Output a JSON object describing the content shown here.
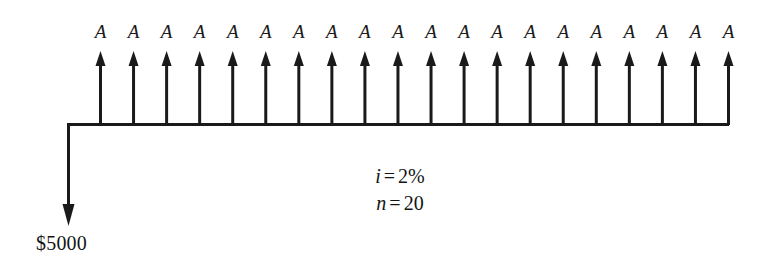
{
  "diagram": {
    "type": "cash-flow-diagram",
    "title": "",
    "background_color": "#ffffff",
    "line_color": "#1a1a1a",
    "principal": {
      "label": "$5000",
      "direction": "down",
      "period": 0
    },
    "annuity": {
      "label": "A",
      "direction": "up",
      "count": 20,
      "labels": [
        "A",
        "A",
        "A",
        "A",
        "A",
        "A",
        "A",
        "A",
        "A",
        "A",
        "A",
        "A",
        "A",
        "A",
        "A",
        "A",
        "A",
        "A",
        "A",
        "A"
      ]
    },
    "parameters": [
      {
        "symbol": "i",
        "equals": "=",
        "value": "2%"
      },
      {
        "symbol": "n",
        "equals": "=",
        "value": "20"
      }
    ]
  },
  "chart_data": {
    "type": "bar",
    "title": "",
    "xlabel": "",
    "ylabel": "",
    "categories": [
      "0",
      "1",
      "2",
      "3",
      "4",
      "5",
      "6",
      "7",
      "8",
      "9",
      "10",
      "11",
      "12",
      "13",
      "14",
      "15",
      "16",
      "17",
      "18",
      "19",
      "20"
    ],
    "values": [
      -5000,
      1,
      1,
      1,
      1,
      1,
      1,
      1,
      1,
      1,
      1,
      1,
      1,
      1,
      1,
      1,
      1,
      1,
      1,
      1,
      1
    ],
    "annotations": [
      "i = 2%",
      "n = 20",
      "$5000",
      "A"
    ],
    "grid": false,
    "legend": "none"
  }
}
